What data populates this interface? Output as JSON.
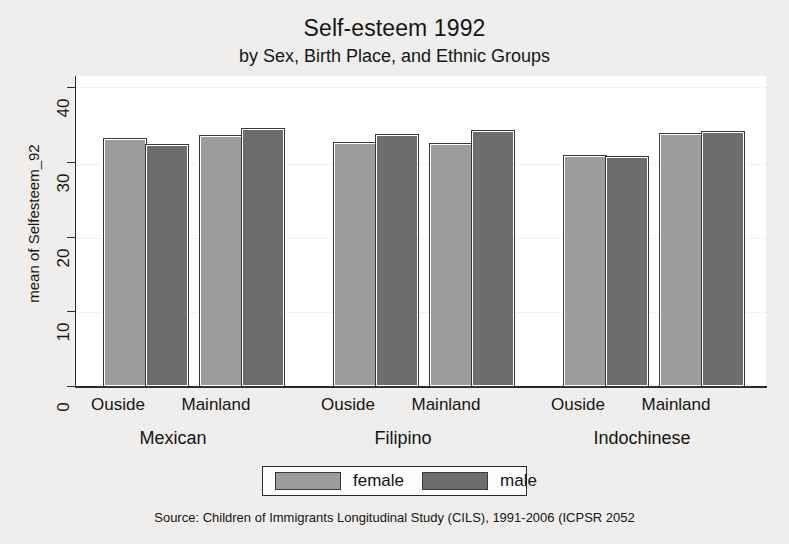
{
  "chart_data": {
    "type": "bar",
    "title": "Self-esteem 1992",
    "subtitle": "by Sex, Birth Place, and Ethnic Groups",
    "ylabel": "mean of Selfesteem_92",
    "xlabel": "",
    "ylim": [
      0,
      40
    ],
    "yticks": [
      0,
      10,
      20,
      30,
      40
    ],
    "ytick_labels": [
      "0",
      "10",
      "20",
      "30",
      "40"
    ],
    "grid": true,
    "legend_position": "bottom",
    "groups": [
      "Mexican",
      "Filipino",
      "Indochinese"
    ],
    "subgroups": [
      "Ouside",
      "Mainland"
    ],
    "categories": [
      "Mexican / Ouside",
      "Mexican / Mainland",
      "Filipino / Ouside",
      "Filipino / Mainland",
      "Indochinese / Ouside",
      "Indochinese / Mainland"
    ],
    "series": [
      {
        "name": "female",
        "color": "#9c9c9c",
        "values": [
          31.9,
          32.3,
          31.4,
          31.2,
          29.7,
          32.5
        ]
      },
      {
        "name": "male",
        "color": "#6d6d6d",
        "values": [
          31.1,
          33.1,
          32.4,
          32.9,
          29.6,
          32.8
        ]
      }
    ],
    "source": "Source:  Children of Immigrants Longitudinal Study (CILS), 1991-2006 (ICPSR 2052"
  },
  "legend": {
    "items": [
      {
        "label": "female",
        "swatch": "female-swatch"
      },
      {
        "label": "male",
        "swatch": "male-swatch"
      }
    ]
  },
  "axis": {
    "y_label": "mean of Selfesteem_92",
    "y_ticks": [
      "40",
      "30",
      "20",
      "10",
      "0"
    ]
  },
  "x_labels": {
    "mexican_outside": "Ouside",
    "mexican_mainland": "Mainland",
    "filipino_outside": "Ouside",
    "filipino_mainland": "Mainland",
    "indochinese_outside": "Ouside",
    "indochinese_mainland": "Mainland",
    "group_mexican": "Mexican",
    "group_filipino": "Filipino",
    "group_indochinese": "Indochinese"
  },
  "header": {
    "title": "Self-esteem 1992",
    "subtitle": "by Sex, Birth Place, and Ethnic Groups"
  },
  "footer": {
    "source": "Source:  Children of Immigrants Longitudinal Study (CILS), 1991-2006 (ICPSR 2052"
  }
}
